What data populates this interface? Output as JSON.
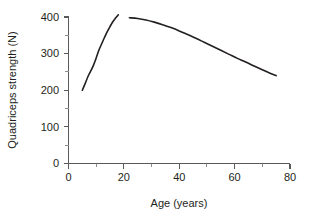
{
  "chart_data": {
    "type": "line",
    "title": "",
    "subtitle": "",
    "xlabel": "Age (years)",
    "ylabel": "Quadriceps strength (N)",
    "xlim": [
      0,
      80
    ],
    "ylim": [
      0,
      400
    ],
    "xticks": [
      0,
      20,
      40,
      60,
      80
    ],
    "yticks": [
      0,
      100,
      200,
      300,
      400
    ],
    "xtick_labels": [
      "0",
      "20",
      "40",
      "60",
      "80"
    ],
    "ytick_labels": [
      "0",
      "100",
      "200",
      "300",
      "400"
    ],
    "x_minor_ticks": [
      10,
      30,
      50,
      70
    ],
    "y_minor_ticks": [
      50,
      150,
      250,
      350
    ],
    "grid": false,
    "legend": false,
    "legend_position": "none",
    "line_color": "#231f20",
    "axis_color": "#58595b",
    "background_color": "#ffffff",
    "series": [
      {
        "name": "growth phase",
        "x": [
          5,
          6,
          7,
          8,
          9,
          10,
          11,
          12,
          13,
          14,
          15,
          16,
          17,
          18
        ],
        "y": [
          200,
          218,
          237,
          252,
          268,
          288,
          310,
          327,
          344,
          360,
          374,
          387,
          397,
          406
        ]
      },
      {
        "name": "decline phase",
        "x": [
          22,
          25,
          28,
          31,
          34,
          37,
          40,
          43,
          46,
          49,
          52,
          55,
          58,
          61,
          64,
          67,
          70,
          73,
          75
        ],
        "y": [
          398,
          396,
          392,
          386,
          379,
          371,
          362,
          352,
          342,
          331,
          320,
          309,
          298,
          287,
          277,
          266,
          256,
          246,
          240
        ]
      }
    ]
  },
  "labels": {
    "x_axis_title": "Age (years)",
    "y_axis_title": "Quadriceps strength (N)"
  }
}
